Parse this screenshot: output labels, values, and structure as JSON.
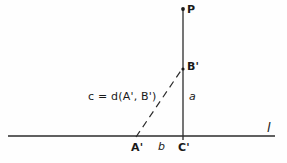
{
  "diagram": {
    "background_color": "#fefefe",
    "stroke_color": "#2b2b2b",
    "labels": {
      "point_P": "P",
      "point_B_prime": "B'",
      "point_A_prime": "A'",
      "point_C_prime": "C'",
      "segment_a": "a",
      "segment_b": "b",
      "line_l": "l",
      "formula": "c = d(A', B')"
    },
    "formula_parts": {
      "lhs": "c",
      "equals": "=",
      "function": "d",
      "open_paren": "(",
      "arg1": "A'",
      "comma": ",",
      "arg2": "B'",
      "close_paren": ")"
    },
    "geometry": {
      "horizontal_line_l": {
        "x1": 8,
        "y1": 136,
        "x2": 275,
        "y2": 136
      },
      "vertical_line": {
        "x1": 183,
        "y1": 8,
        "x2": 183,
        "y2": 140
      },
      "dashed_segment_c": {
        "x1": 136,
        "y1": 137,
        "x2": 182,
        "y2": 69
      },
      "point_P": {
        "x": 183,
        "y": 9
      },
      "point_B_prime": {
        "x": 183,
        "y": 69
      },
      "point_A_prime": {
        "x": 136,
        "y": 136
      },
      "point_C_prime": {
        "x": 183,
        "y": 136
      },
      "dash_pattern": "7 5"
    }
  }
}
